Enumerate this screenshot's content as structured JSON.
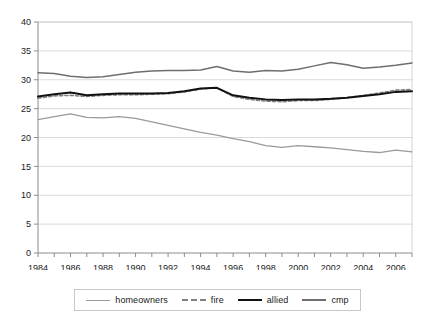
{
  "chart_data": {
    "type": "line",
    "title": "",
    "subtitle": "",
    "xlabel": "",
    "ylabel": "",
    "xlim": [
      1984,
      2007
    ],
    "ylim": [
      0,
      40
    ],
    "ytick_step": 5,
    "grid": "horizontal",
    "legend_position": "bottom",
    "x": [
      1984,
      1985,
      1986,
      1987,
      1988,
      1989,
      1990,
      1991,
      1992,
      1993,
      1994,
      1995,
      1996,
      1997,
      1998,
      1999,
      2000,
      2001,
      2002,
      2003,
      2004,
      2005,
      2006,
      2007
    ],
    "xticks": [
      1984,
      1986,
      1988,
      1990,
      1992,
      1994,
      1996,
      1998,
      2000,
      2002,
      2004,
      2006
    ],
    "xtick_labels": [
      "1984",
      "1986",
      "1988",
      "1990",
      "1992",
      "1994",
      "1996",
      "1998",
      "2000",
      "2002",
      "2004",
      "2006"
    ],
    "yticks": [
      0,
      5,
      10,
      15,
      20,
      25,
      30,
      35,
      40
    ],
    "ytick_labels": [
      "0",
      "5",
      "10",
      "15",
      "20",
      "25",
      "30",
      "35",
      "40"
    ],
    "series": [
      {
        "name": "homeowners",
        "color": "#9a9a9a",
        "style": "solid",
        "width": 1.3,
        "values": [
          23.1,
          23.6,
          24.1,
          23.5,
          23.4,
          23.6,
          23.3,
          22.7,
          22.1,
          21.5,
          20.9,
          20.4,
          19.8,
          19.3,
          18.6,
          18.3,
          18.6,
          18.4,
          18.2,
          17.9,
          17.6,
          17.4,
          17.8,
          17.5
        ]
      },
      {
        "name": "fire",
        "color": "#808080",
        "style": "dashed",
        "width": 1.6,
        "values": [
          26.8,
          27.2,
          27.3,
          27.1,
          27.3,
          27.4,
          27.4,
          27.5,
          27.6,
          27.9,
          28.4,
          28.6,
          27.1,
          26.6,
          26.3,
          26.2,
          26.4,
          26.4,
          26.6,
          26.9,
          27.3,
          27.7,
          28.2,
          28.3
        ]
      },
      {
        "name": "allied",
        "color": "#111111",
        "style": "solid",
        "width": 2.0,
        "values": [
          27.1,
          27.5,
          27.8,
          27.3,
          27.5,
          27.6,
          27.6,
          27.6,
          27.7,
          28.0,
          28.5,
          28.6,
          27.3,
          26.9,
          26.6,
          26.5,
          26.6,
          26.6,
          26.7,
          26.9,
          27.2,
          27.5,
          27.9,
          28.0
        ]
      },
      {
        "name": "cmp",
        "color": "#6e6e6e",
        "style": "solid",
        "width": 1.5,
        "values": [
          31.2,
          31.1,
          30.6,
          30.4,
          30.5,
          30.9,
          31.3,
          31.5,
          31.6,
          31.6,
          31.7,
          32.3,
          31.5,
          31.3,
          31.6,
          31.5,
          31.8,
          32.4,
          33.0,
          32.6,
          32.0,
          32.2,
          32.5,
          32.9
        ]
      }
    ]
  },
  "legend": {
    "entries": [
      {
        "label": "homeowners"
      },
      {
        "label": "fire"
      },
      {
        "label": "allied"
      },
      {
        "label": "cmp"
      }
    ]
  },
  "axes": {
    "y_axis_name": "y-axis",
    "x_axis_name": "x-axis"
  }
}
